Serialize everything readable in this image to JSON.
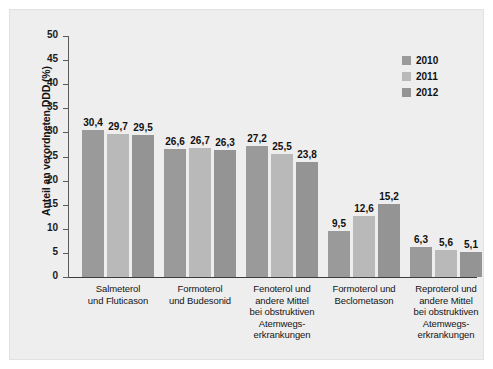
{
  "chart_data": {
    "type": "bar",
    "title": "",
    "xlabel": "",
    "ylabel": "Anteil an verordneten DDD (%)",
    "ylim": [
      0,
      50
    ],
    "ytick_step": 5,
    "yticks": [
      "50",
      "45",
      "40",
      "35",
      "30",
      "25",
      "20",
      "15",
      "10",
      "5",
      "0"
    ],
    "grid": false,
    "legend_position": "top-right",
    "decimal_separator": ",",
    "categories": [
      "Salmeterol und Fluticason",
      "Formoterol und Budesonid",
      "Fenoterol und andere Mittel bei obstruktiven Atemwegs-erkrankungen",
      "Formoterol und Beclometason",
      "Reproterol und andere Mittel bei obstruktiven Atemwegs-erkrankungen"
    ],
    "category_lines": [
      [
        "Salmeterol",
        "und Fluticason"
      ],
      [
        "Formoterol",
        "und Budesonid"
      ],
      [
        "Fenoterol und",
        "andere Mittel",
        "bei obstruktiven",
        "Atemwegs-",
        "erkrankungen"
      ],
      [
        "Formoterol und",
        "Beclometason"
      ],
      [
        "Reproterol und",
        "andere Mittel",
        "bei obstruktiven",
        "Atemwegs-",
        "erkrankungen"
      ]
    ],
    "series": [
      {
        "name": "2010",
        "color": "#9a9a9a",
        "values": [
          30.4,
          26.6,
          27.2,
          9.5,
          6.3
        ],
        "labels": [
          "30,4",
          "26,6",
          "27,2",
          "9,5",
          "6,3"
        ]
      },
      {
        "name": "2011",
        "color": "#b9b9b9",
        "values": [
          29.7,
          26.7,
          25.5,
          12.6,
          5.6
        ],
        "labels": [
          "29,7",
          "26,7",
          "25,5",
          "12,6",
          "5,6"
        ]
      },
      {
        "name": "2012",
        "color": "#949494",
        "values": [
          29.5,
          26.3,
          23.8,
          15.2,
          5.1
        ],
        "labels": [
          "29,5",
          "26,3",
          "23,8",
          "15,2",
          "5,1"
        ]
      }
    ]
  },
  "legend": {
    "items": [
      {
        "label": "2010",
        "color": "#9a9a9a"
      },
      {
        "label": "2011",
        "color": "#b9b9b9"
      },
      {
        "label": "2012",
        "color": "#949494"
      }
    ]
  },
  "figure": {
    "background": "#eeeeee",
    "border_color": "#e2e2e2",
    "axis_color": "#5a5a5a"
  }
}
